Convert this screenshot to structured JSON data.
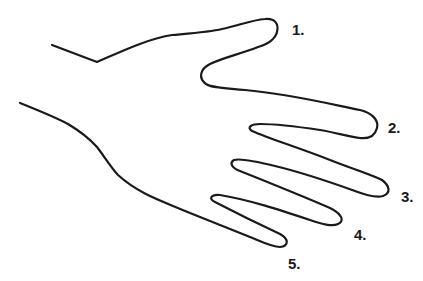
{
  "diagram": {
    "stroke_color": "#1a1a1a",
    "background_color": "#ffffff",
    "labels": [
      {
        "id": "thumb",
        "text": "1.",
        "x": 292,
        "y": 22
      },
      {
        "id": "index",
        "text": "2.",
        "x": 388,
        "y": 120
      },
      {
        "id": "middle",
        "text": "3.",
        "x": 401,
        "y": 189
      },
      {
        "id": "ring",
        "text": "4.",
        "x": 354,
        "y": 227
      },
      {
        "id": "pinky",
        "text": "5.",
        "x": 288,
        "y": 256
      }
    ]
  }
}
